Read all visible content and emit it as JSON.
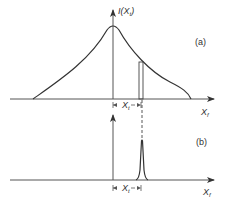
{
  "diagram": {
    "panel_a": {
      "label": "(a)",
      "y_axis_label": "I(X",
      "y_axis_label_sub": "t",
      "y_axis_label_close": ")",
      "x_axis_label": "X",
      "x_axis_label_sub": "f",
      "offset_label": "X",
      "offset_label_sub": "t",
      "curve": "symmetric cusp-shaped (exponential-like) intensity profile centered on vertical axis",
      "highlighted_sample": "narrow vertical bar at offset X_t from center"
    },
    "panel_b": {
      "label": "(b)",
      "x_axis_label": "X",
      "x_axis_label_sub": "f",
      "offset_label": "X",
      "offset_label_sub": "t",
      "curve": "narrow peak located at offset X_t from vertical axis"
    },
    "colors": {
      "line": "#333333",
      "background": "#ffffff"
    }
  }
}
